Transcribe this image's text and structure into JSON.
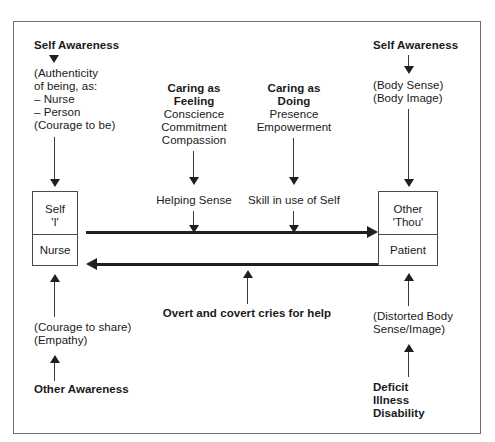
{
  "diagram": {
    "border_color": "#6f6f6f",
    "ink_color": "#1f1f1f",
    "columns": {
      "left": {
        "top_heading": "Self Awareness",
        "top_detail_lines": [
          "(Authenticity",
          "of being, as:",
          "– Nurse",
          "– Person",
          "(Courage to be)"
        ],
        "box": {
          "upper_line_1": "Self",
          "upper_line_2": "'I'",
          "lower": "Nurse"
        },
        "bottom_detail_lines": [
          "(Courage to share)",
          "(Empathy)"
        ],
        "bottom_heading": "Other Awareness"
      },
      "center_feeling": {
        "heading_line_1": "Caring as",
        "heading_line_2": "Feeling",
        "detail_lines": [
          "Conscience",
          "Commitment",
          "Compassion"
        ],
        "outcome": "Helping Sense"
      },
      "center_doing": {
        "heading_line_1": "Caring as",
        "heading_line_2": "Doing",
        "detail_lines": [
          "Presence",
          "Empowerment"
        ],
        "outcome": "Skill in use of Self"
      },
      "right": {
        "top_heading": "Self Awareness",
        "top_detail_lines": [
          "(Body Sense)",
          "(Body Image)"
        ],
        "box": {
          "upper_line_1": "Other",
          "upper_line_2": "'Thou'",
          "lower": "Patient"
        },
        "bottom_detail_lines": [
          "(Distorted Body",
          "Sense/Image)"
        ],
        "bottom_heading_lines": [
          "Deficit",
          "Illness",
          "Disability"
        ]
      }
    },
    "exchange": {
      "forward_label": "",
      "return_label": "Overt and covert cries for help"
    }
  }
}
